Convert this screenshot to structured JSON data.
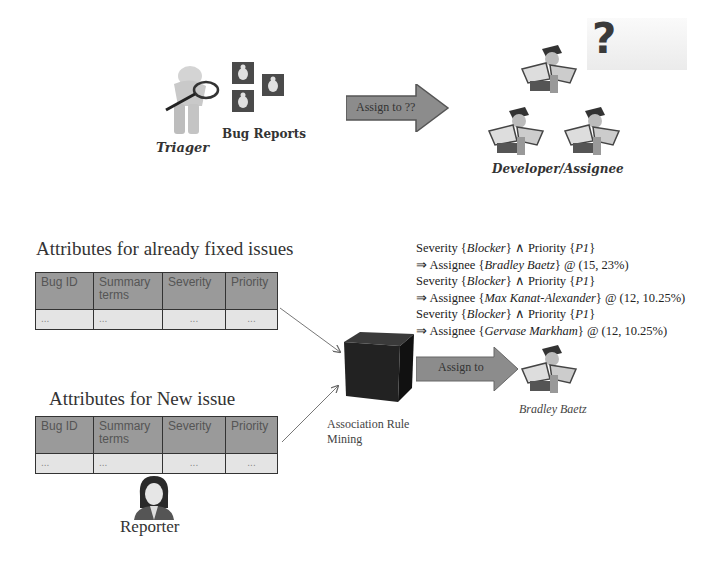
{
  "top": {
    "triager_label": "Triager",
    "bug_reports_label": "Bug Reports",
    "assign_arrow_label": "Assign to ??",
    "developer_label": "Developer/Assignee"
  },
  "fixed_issues": {
    "title": "Attributes for already fixed issues",
    "columns": [
      "Bug ID",
      "Summary terms",
      "Severity",
      "Priority"
    ],
    "row": [
      "...",
      "...",
      "...",
      "..."
    ]
  },
  "new_issue": {
    "title": "Attributes for New issue",
    "columns": [
      "Bug ID",
      "Summary terms",
      "Severity",
      "Priority"
    ],
    "row": [
      "...",
      "...",
      "...",
      "..."
    ],
    "reporter_label": "Reporter"
  },
  "mining": {
    "label_line1": "Association Rule",
    "label_line2": "Mining",
    "assign_arrow_label": "Assign to",
    "result_label": "Bradley Baetz"
  },
  "rules": [
    {
      "condition_prefix": "Severity {",
      "severity": "Blocker",
      "condition_mid": "} ∧ Priority {",
      "priority": "P1",
      "condition_suffix": "}",
      "result_prefix": "⇒ Assignee {",
      "assignee": "Bradley Baetz",
      "result_suffix": "} @ (15, 23%)"
    },
    {
      "condition_prefix": "Severity {",
      "severity": "Blocker",
      "condition_mid": "} ∧ Priority {",
      "priority": "P1",
      "condition_suffix": "}",
      "result_prefix": "⇒ Assignee {",
      "assignee": "Max Kanat-Alexander",
      "result_suffix": "} @ (12, 10.25%)"
    },
    {
      "condition_prefix": "Severity {",
      "severity": "Blocker",
      "condition_mid": "} ∧ Priority {",
      "priority": "P1",
      "condition_suffix": "}",
      "result_prefix": "⇒ Assignee {",
      "assignee": "Gervase Markham",
      "result_suffix": "} @ (12, 10.25%)"
    }
  ],
  "colors": {
    "arrow_fill": "#8c8c8c",
    "table_header": "#9a9a9a",
    "table_row": "#e4e4e4",
    "cube": "#1e1e1e"
  }
}
